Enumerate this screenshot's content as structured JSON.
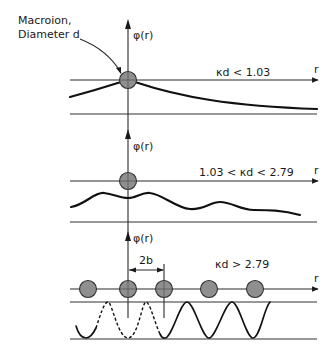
{
  "figure": {
    "annotation": {
      "line1": "Macroion,",
      "line2": "Diameter d"
    },
    "panels": [
      {
        "id": "panel-1",
        "y_axis_label": "φ(r)",
        "x_axis_label": "r",
        "condition": "κd < 1.03",
        "description": "monotonic decay from macroion"
      },
      {
        "id": "panel-2",
        "y_axis_label": "φ(r)",
        "x_axis_label": "r",
        "condition": "1.03 < κd < 2.79",
        "description": "damped oscillation"
      },
      {
        "id": "panel-3",
        "y_axis_label": "φ(r)",
        "x_axis_label": "r",
        "condition": "κd > 2.79",
        "spacing_label": "2b",
        "description": "periodic ordering of macroions",
        "macroion_count": 5
      }
    ],
    "colors": {
      "ink": "#111111",
      "macroion_fill": "#8f8f8f",
      "background": "#ffffff"
    }
  }
}
